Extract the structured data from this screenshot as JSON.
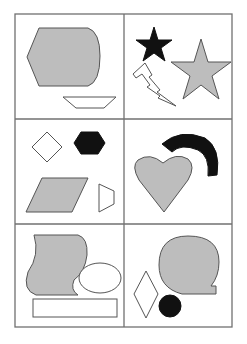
{
  "figure": {
    "title": "",
    "layout": {
      "rows": 3,
      "cols": 2
    },
    "colors": {
      "gray": "#bdbdbd",
      "black": "#111111",
      "outline": "#555555",
      "grid": "#707070",
      "background": "#ffffff"
    },
    "cells": [
      {
        "id": "r1c1",
        "shapes": [
          "gray irregular hexagon-like polygon with rounded right side",
          "white trapezoid (wide top)"
        ]
      },
      {
        "id": "r1c2",
        "shapes": [
          "black five-point star (small)",
          "gray five-point star (large)",
          "white lightning bolt"
        ]
      },
      {
        "id": "r2c1",
        "shapes": [
          "white diamond",
          "black hexagon",
          "gray parallelogram",
          "white trapezoid (sideways)"
        ]
      },
      {
        "id": "r2c2",
        "shapes": [
          "gray heart",
          "black semicircular arc"
        ]
      },
      {
        "id": "r3c1",
        "shapes": [
          "gray wavy banner shape",
          "white ellipse",
          "white rectangle"
        ]
      },
      {
        "id": "r3c2",
        "shapes": [
          "gray circle with notch (speech bubble-like)",
          "white diamond",
          "black circle"
        ]
      }
    ]
  }
}
